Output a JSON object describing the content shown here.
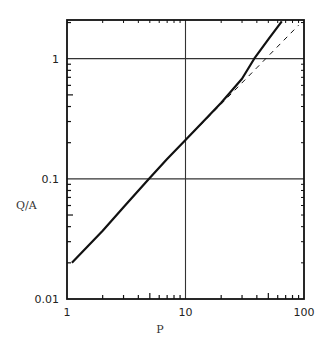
{
  "chart_data": {
    "type": "line",
    "title": "",
    "xlabel": "P",
    "ylabel": "Q/A",
    "xscale": "log",
    "yscale": "log",
    "xlim": [
      1,
      100
    ],
    "ylim": [
      0.01,
      2.1
    ],
    "x_ticks": [
      1,
      10,
      100
    ],
    "x_tick_labels": [
      "1",
      "10",
      "100"
    ],
    "y_ticks": [
      0.01,
      0.1,
      1
    ],
    "y_tick_labels": [
      "0.01",
      "0.1",
      "1"
    ],
    "grid": "major lines at x=10, y=0.1, y=1",
    "legend": "none",
    "series": [
      {
        "name": "solid curve",
        "style": "solid",
        "x": [
          1.1,
          2,
          3,
          4.9,
          7,
          10,
          15,
          20,
          30,
          38,
          50,
          65
        ],
        "y": [
          0.02,
          0.037,
          0.058,
          0.1,
          0.146,
          0.21,
          0.32,
          0.43,
          0.68,
          1.0,
          1.45,
          2.05
        ]
      },
      {
        "name": "dashed asymptote",
        "style": "dashed",
        "x": [
          10,
          20,
          40,
          90
        ],
        "y": [
          0.21,
          0.42,
          0.84,
          1.9
        ]
      }
    ]
  }
}
